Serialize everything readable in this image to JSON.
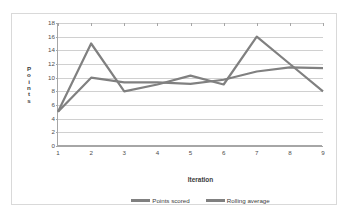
{
  "chart_data": {
    "type": "line",
    "title": "",
    "xlabel": "Iteration",
    "ylabel": "Points",
    "x": [
      1,
      2,
      3,
      4,
      5,
      6,
      7,
      8,
      9
    ],
    "xtick_labels": [
      "1",
      "2",
      "3",
      "4",
      "5",
      "6",
      "7",
      "8",
      "9"
    ],
    "ytick_labels": [
      "0",
      "2",
      "4",
      "6",
      "8",
      "10",
      "12",
      "14",
      "16",
      "18"
    ],
    "ytick_values": [
      0,
      2,
      4,
      6,
      8,
      10,
      12,
      14,
      16,
      18
    ],
    "ylim": [
      0,
      18
    ],
    "xlim": [
      1,
      9
    ],
    "grid": "horizontal",
    "legend_position": "bottom",
    "series": [
      {
        "name": "Points scored",
        "color": "#808080",
        "values": [
          5,
          15,
          8,
          9,
          10.3,
          9,
          16,
          12,
          8
        ]
      },
      {
        "name": "Rolling average",
        "color": "#808080",
        "values": [
          5,
          10,
          9.3,
          9.3,
          9.1,
          9.7,
          10.9,
          11.5,
          11.4
        ]
      }
    ]
  },
  "colors": {
    "series_line": "#808080",
    "gridline": "#d0d0d0",
    "axis": "#a6a6a6",
    "frame_border": "#d9d9d9",
    "plot_background": "#ffffff",
    "tick_text": "#4d4d4d",
    "axis_title_text": "#3c3c3c"
  }
}
